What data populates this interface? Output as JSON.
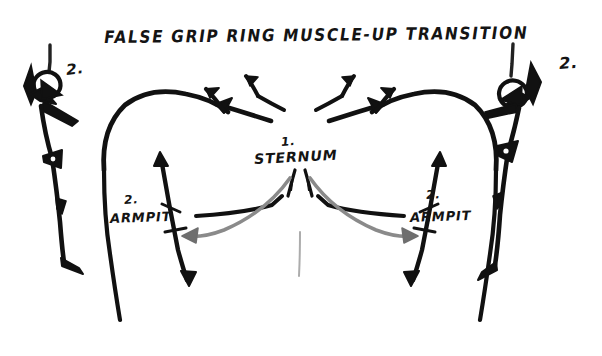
{
  "canvas": {
    "width": 602,
    "height": 356,
    "background_color": "#ffffff",
    "ink_color": "#111111",
    "secondary_ink_color": "#8a8a8a",
    "medium": "marker-sketch",
    "subject": "anatomy-diagram"
  },
  "title": {
    "text": "FALSE GRIP RING MUSCLE-UP TRANSITION"
  },
  "labels": {
    "sternum": {
      "number": "1.",
      "text": "STERNUM"
    },
    "armpit_left": {
      "number": "2.",
      "text": "ARMPIT"
    },
    "armpit_right": {
      "number": "2.",
      "text": "ARMPIT"
    },
    "figure_left": {
      "number": "2."
    },
    "figure_right": {
      "number": "2."
    }
  },
  "diagram": {
    "center_subject": "front-view-torso-shoulders",
    "left_subject": "stick-figure-on-ring-false-grip",
    "right_subject": "stick-figure-on-ring-false-grip",
    "annotations": [
      {
        "name": "collarbone-arrow-left",
        "direction": "up-and-out",
        "color": "#111111"
      },
      {
        "name": "collarbone-arrow-right",
        "direction": "up-and-out",
        "color": "#111111"
      },
      {
        "name": "sternum-to-armpit-arrow-left",
        "direction": "sternum-down-to-left-armpit",
        "color": "#8a8a8a"
      },
      {
        "name": "sternum-to-armpit-arrow-right",
        "direction": "sternum-down-to-right-armpit",
        "color": "#8a8a8a"
      },
      {
        "name": "armpit-vertical-arrow-left",
        "direction": "double-headed-vertical",
        "color": "#111111"
      },
      {
        "name": "armpit-vertical-arrow-right",
        "direction": "double-headed-vertical",
        "color": "#111111"
      }
    ]
  }
}
